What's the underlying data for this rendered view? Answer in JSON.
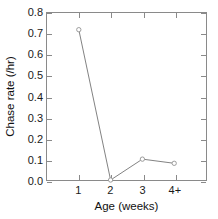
{
  "chart_data": {
    "type": "line",
    "title": "",
    "xlabel": "Age (weeks)",
    "ylabel": "Chase rate (/hr)",
    "categories": [
      "1",
      "2",
      "3",
      "4+"
    ],
    "values": [
      0.72,
      0.0,
      0.1,
      0.08
    ],
    "series": [
      {
        "name": "Chase rate",
        "values": [
          0.72,
          0.0,
          0.1,
          0.08
        ]
      }
    ],
    "ylim": [
      0.0,
      0.8
    ],
    "ytick_labels": [
      "0.0",
      "0.1",
      "0.2",
      "0.3",
      "0.4",
      "0.5",
      "0.6",
      "0.7",
      "0.8"
    ],
    "ytick_values": [
      0.0,
      0.1,
      0.2,
      0.3,
      0.4,
      0.5,
      0.6,
      0.7,
      0.8
    ],
    "xtick_labels": [
      "1",
      "2",
      "3",
      "4+"
    ],
    "grid": false,
    "legend": "none",
    "marker": "open-circle",
    "line_color": "#808080",
    "marker_color": "#9a9a9a",
    "axis_color": "#8a8a8a",
    "text_color": "#1a1a1a"
  }
}
